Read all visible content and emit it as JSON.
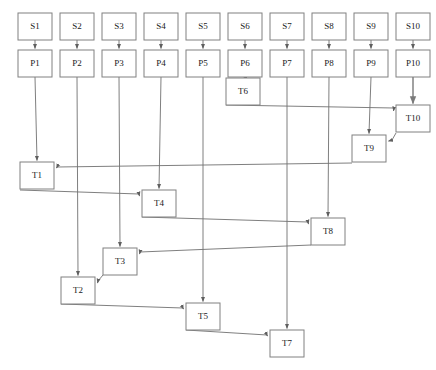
{
  "diagram": {
    "type": "directed-graph",
    "background_color": "#ffffff",
    "node_fill": "#ffffff",
    "node_stroke": "#808080",
    "edge_color": "#707070",
    "label_color": "#1a1a1a",
    "node_width": 34,
    "node_height": 27,
    "nodes": [
      {
        "id": "S1",
        "label": "S1",
        "x": 18,
        "y": 13,
        "row": "source"
      },
      {
        "id": "S2",
        "label": "S2",
        "x": 60,
        "y": 13,
        "row": "source"
      },
      {
        "id": "S3",
        "label": "S3",
        "x": 102,
        "y": 13,
        "row": "source"
      },
      {
        "id": "S4",
        "label": "S4",
        "x": 144,
        "y": 13,
        "row": "source"
      },
      {
        "id": "S5",
        "label": "S5",
        "x": 186,
        "y": 13,
        "row": "source"
      },
      {
        "id": "S6",
        "label": "S6",
        "x": 228,
        "y": 13,
        "row": "source"
      },
      {
        "id": "S7",
        "label": "S7",
        "x": 270,
        "y": 13,
        "row": "source"
      },
      {
        "id": "S8",
        "label": "S8",
        "x": 312,
        "y": 13,
        "row": "source"
      },
      {
        "id": "S9",
        "label": "S9",
        "x": 354,
        "y": 13,
        "row": "source"
      },
      {
        "id": "S10",
        "label": "S10",
        "x": 396,
        "y": 13,
        "row": "source"
      },
      {
        "id": "P1",
        "label": "P1",
        "x": 18,
        "y": 50,
        "row": "process"
      },
      {
        "id": "P2",
        "label": "P2",
        "x": 60,
        "y": 50,
        "row": "process"
      },
      {
        "id": "P3",
        "label": "P3",
        "x": 102,
        "y": 50,
        "row": "process"
      },
      {
        "id": "P4",
        "label": "P4",
        "x": 144,
        "y": 50,
        "row": "process"
      },
      {
        "id": "P5",
        "label": "P5",
        "x": 186,
        "y": 50,
        "row": "process"
      },
      {
        "id": "P6",
        "label": "P6",
        "x": 228,
        "y": 50,
        "row": "process"
      },
      {
        "id": "P7",
        "label": "P7",
        "x": 270,
        "y": 50,
        "row": "process"
      },
      {
        "id": "P8",
        "label": "P8",
        "x": 312,
        "y": 50,
        "row": "process"
      },
      {
        "id": "P9",
        "label": "P9",
        "x": 354,
        "y": 50,
        "row": "process"
      },
      {
        "id": "P10",
        "label": "P10",
        "x": 396,
        "y": 50,
        "row": "process"
      },
      {
        "id": "T6",
        "label": "T6",
        "x": 226,
        "y": 78,
        "row": "task"
      },
      {
        "id": "T10",
        "label": "T10",
        "x": 396,
        "y": 105,
        "row": "task"
      },
      {
        "id": "T9",
        "label": "T9",
        "x": 352,
        "y": 135,
        "row": "task"
      },
      {
        "id": "T1",
        "label": "T1",
        "x": 20,
        "y": 162,
        "row": "task"
      },
      {
        "id": "T4",
        "label": "T4",
        "x": 142,
        "y": 190,
        "row": "task"
      },
      {
        "id": "T8",
        "label": "T8",
        "x": 311,
        "y": 218,
        "row": "task"
      },
      {
        "id": "T3",
        "label": "T3",
        "x": 103,
        "y": 248,
        "row": "task"
      },
      {
        "id": "T2",
        "label": "T2",
        "x": 61,
        "y": 277,
        "row": "task"
      },
      {
        "id": "T5",
        "label": "T5",
        "x": 186,
        "y": 303,
        "row": "task"
      },
      {
        "id": "T7",
        "label": "T7",
        "x": 270,
        "y": 330,
        "row": "task"
      }
    ],
    "edges": [
      {
        "from": "S1",
        "to": "P1",
        "kind": "short-vertical"
      },
      {
        "from": "S2",
        "to": "P2",
        "kind": "short-vertical"
      },
      {
        "from": "S3",
        "to": "P3",
        "kind": "short-vertical"
      },
      {
        "from": "S4",
        "to": "P4",
        "kind": "short-vertical"
      },
      {
        "from": "S5",
        "to": "P5",
        "kind": "short-vertical"
      },
      {
        "from": "S6",
        "to": "P6",
        "kind": "short-vertical"
      },
      {
        "from": "S7",
        "to": "P7",
        "kind": "short-vertical"
      },
      {
        "from": "S8",
        "to": "P8",
        "kind": "short-vertical"
      },
      {
        "from": "S9",
        "to": "P9",
        "kind": "short-vertical"
      },
      {
        "from": "S10",
        "to": "P10",
        "kind": "short-vertical"
      },
      {
        "from": "P6",
        "to": "T6",
        "kind": "vertical"
      },
      {
        "from": "P10",
        "to": "T10",
        "kind": "vertical"
      },
      {
        "from": "P9",
        "to": "T9",
        "kind": "vertical"
      },
      {
        "from": "P1",
        "to": "T1",
        "kind": "vertical"
      },
      {
        "from": "P4",
        "to": "T4",
        "kind": "vertical"
      },
      {
        "from": "P8",
        "to": "T8",
        "kind": "vertical"
      },
      {
        "from": "P3",
        "to": "T3",
        "kind": "vertical"
      },
      {
        "from": "P2",
        "to": "T2",
        "kind": "vertical"
      },
      {
        "from": "P5",
        "to": "T5",
        "kind": "vertical"
      },
      {
        "from": "P7",
        "to": "T7",
        "kind": "vertical"
      },
      {
        "from": "T6",
        "to": "T10",
        "kind": "chain"
      },
      {
        "from": "T10",
        "to": "T9",
        "kind": "chain"
      },
      {
        "from": "T9",
        "to": "T1",
        "kind": "chain"
      },
      {
        "from": "T1",
        "to": "T4",
        "kind": "chain"
      },
      {
        "from": "T4",
        "to": "T8",
        "kind": "chain"
      },
      {
        "from": "T8",
        "to": "T3",
        "kind": "chain"
      },
      {
        "from": "T3",
        "to": "T2",
        "kind": "chain"
      },
      {
        "from": "T2",
        "to": "T5",
        "kind": "chain"
      },
      {
        "from": "T5",
        "to": "T7",
        "kind": "chain"
      }
    ]
  }
}
